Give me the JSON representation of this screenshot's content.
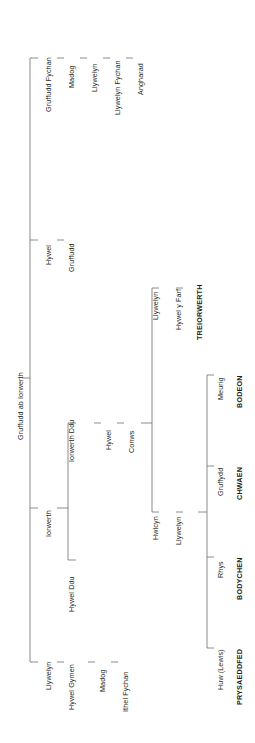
{
  "chart_type": "genealogical-tree",
  "orientation": "left-to-right, labels rotated 90 degrees counter-clockwise",
  "root": {
    "name": "Gruffudd ab Iorwerth"
  },
  "branches": [
    {
      "id": "gruffudd-fychan",
      "chain": [
        {
          "name": "Gruffudd Fychan",
          "bold": false
        },
        {
          "name": "Madog",
          "bold": false
        },
        {
          "name": "Llywelyn",
          "bold": false
        },
        {
          "name": "Llywelyn Fychan",
          "bold": false
        },
        {
          "name": "Angharad",
          "bold": false
        }
      ]
    },
    {
      "id": "hywel",
      "chain": [
        {
          "name": "Hywel",
          "bold": false
        },
        {
          "name": "Gruffudd",
          "bold": false
        }
      ]
    },
    {
      "id": "iorwerth",
      "chain": [
        {
          "name": "Iorwerth",
          "bold": false
        }
      ],
      "children": [
        {
          "id": "iorwerth-ddu",
          "chain": [
            {
              "name": "Iorwerth Ddu",
              "bold": false
            },
            {
              "name": "Hywel",
              "bold": false
            },
            {
              "name": "Conws",
              "bold": false
            }
          ],
          "children": [
            {
              "id": "llywelyn-treiorwerth",
              "chain": [
                {
                  "name": "Llywelyn",
                  "bold": false
                },
                {
                  "name": "Hywel y Farf",
                  "bold": false
                },
                {
                  "name": "TREIORWERTH",
                  "bold": true
                }
              ]
            },
            {
              "id": "hwlcyn",
              "chain": [
                {
                  "name": "Hwlcyn",
                  "bold": false
                },
                {
                  "name": "Llywelyn",
                  "bold": false
                }
              ],
              "children": [
                {
                  "id": "meurig",
                  "chain": [
                    {
                      "name": "Meurig",
                      "bold": false
                    },
                    {
                      "name": "BODEON",
                      "bold": true
                    }
                  ]
                },
                {
                  "id": "gruffydd",
                  "chain": [
                    {
                      "name": "Gruffydd",
                      "bold": false
                    },
                    {
                      "name": "CHWAEN",
                      "bold": true
                    }
                  ]
                },
                {
                  "id": "rhys",
                  "chain": [
                    {
                      "name": "Rhys",
                      "bold": false
                    },
                    {
                      "name": "BODYCHEN",
                      "bold": true
                    }
                  ]
                },
                {
                  "id": "huw-lewis",
                  "chain": [
                    {
                      "name": "Huw (Lewis)",
                      "bold": false
                    },
                    {
                      "name": "PRYSAEDDFED",
                      "bold": true
                    }
                  ]
                }
              ]
            }
          ]
        },
        {
          "id": "hywel-ddu",
          "chain": [
            {
              "name": "Hywel Ddu",
              "bold": false
            }
          ]
        }
      ]
    },
    {
      "id": "llywelyn-bottom",
      "chain": [
        {
          "name": "Llywelyn",
          "bold": false
        },
        {
          "name": "Hywel Gymen",
          "bold": false
        },
        {
          "name": "Madog",
          "bold": false
        },
        {
          "name": "Ithel Fychan",
          "bold": false
        }
      ]
    }
  ],
  "labels": {
    "root": "Gruffudd ab Iorwerth",
    "n_gruffudd_fychan": "Gruffudd Fychan",
    "n_madog_1": "Madog",
    "n_llywelyn_1": "Llywelyn",
    "n_llywelyn_fychan": "Llywelyn Fychan",
    "n_angharad": "Angharad",
    "n_hywel_1": "Hywel",
    "n_gruffudd_1": "Gruffudd",
    "n_iorwerth": "Iorwerth",
    "n_iorwerth_ddu": "Iorwerth Ddu",
    "n_hywel_2": "Hywel",
    "n_conws": "Conws",
    "n_llywelyn_2": "Llywelyn",
    "n_hywel_y_farf": "Hywel y Farf",
    "n_treiorwerth": "TREIORWERTH",
    "n_hwlcyn": "Hwlcyn",
    "n_llywelyn_3": "Llywelyn",
    "n_meurig": "Meurig",
    "n_bodeon": "BODEON",
    "n_gruffydd": "Gruffydd",
    "n_chwaen": "CHWAEN",
    "n_rhys": "Rhys",
    "n_bodychen": "BODYCHEN",
    "n_huw_lewis": "Huw (Lewis)",
    "n_prysaeddfed": "PRYSAEDDFED",
    "n_hywel_ddu": "Hywel Ddu",
    "n_llywelyn_4": "Llywelyn",
    "n_hywel_gymen": "Hywel Gymen",
    "n_madog_2": "Madog",
    "n_ithel_fychan": "Ithel Fychan"
  },
  "colors": {
    "text": "#231f20",
    "line": "#6d6e71",
    "background": "#ffffff"
  }
}
